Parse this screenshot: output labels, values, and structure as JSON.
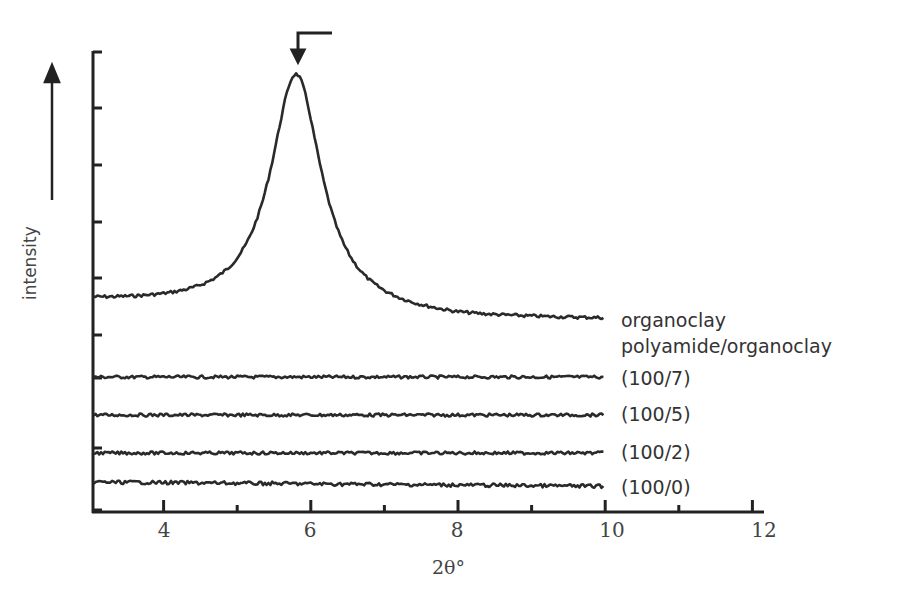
{
  "chart_data": {
    "type": "line",
    "title": "",
    "xlabel": "2θ°",
    "ylabel": "intensity",
    "xlim": [
      3,
      12
    ],
    "x_ticks": [
      4,
      6,
      8,
      10,
      12
    ],
    "x_tick_labels": [
      "4",
      "6",
      "8",
      "10",
      "12"
    ],
    "x_minor_ticks": [
      5,
      7,
      9,
      11
    ],
    "y_ticks_unlabeled": true,
    "grid": false,
    "legend_position": "inline-right",
    "annotation": "arrow marking peak at 2θ ≈ 5.8°",
    "series": [
      {
        "name": "organoclay",
        "offset_y": 302,
        "peak_x": 5.8,
        "peak_height": 238,
        "tail_y": 320,
        "description": "strong basal reflection peak at ~5.8°"
      },
      {
        "name": "(100/7)",
        "offset_y": 377,
        "description": "flat, no peak"
      },
      {
        "name": "(100/5)",
        "offset_y": 415,
        "description": "flat, no peak"
      },
      {
        "name": "(100/2)",
        "offset_y": 453,
        "description": "flat, no peak"
      },
      {
        "name": "(100/0)",
        "offset_y": 485,
        "description": "flat, slight downward slope"
      }
    ],
    "group_label": "polyamide/organoclay"
  },
  "labels": {
    "organoclay": "organoclay",
    "group": "polyamide/organoclay",
    "s7": "(100/7)",
    "s5": "(100/5)",
    "s2": "(100/2)",
    "s0": "(100/0)"
  },
  "axes": {
    "xlabel": "2θ°",
    "ylabel": "intensity",
    "xt": [
      "4",
      "6",
      "8",
      "10",
      "12"
    ]
  }
}
